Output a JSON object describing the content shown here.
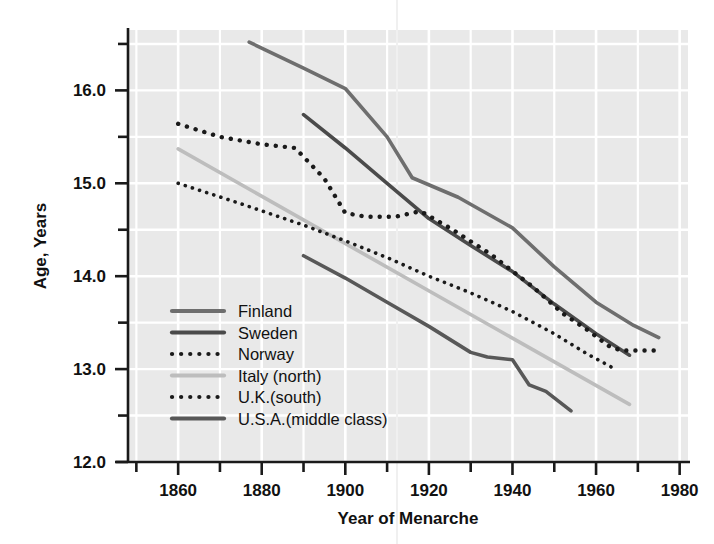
{
  "chart_data": {
    "type": "line",
    "title": "",
    "xlabel": "Year of Menarche",
    "ylabel": "Age, Years",
    "xlim": [
      1848,
      1982
    ],
    "ylim": [
      12.0,
      16.65
    ],
    "xticks": [
      1860,
      1880,
      1900,
      1920,
      1940,
      1960,
      1980
    ],
    "xtick_labels": [
      "1860",
      "1880",
      "1900",
      "1920",
      "1940",
      "1960",
      "1980"
    ],
    "xminor_step": 10,
    "yticks": [
      12.0,
      13.0,
      14.0,
      15.0,
      16.0
    ],
    "ytick_labels": [
      "12.0",
      "13.0",
      "14.0",
      "15.0",
      "16.0"
    ],
    "yminor_ticks": [
      12.5,
      13.5,
      14.5,
      15.5
    ],
    "grid": true,
    "grid_color": "#ffffff",
    "plot_background": "#e9e9e9",
    "legend_position": "lower-left-inside",
    "series": [
      {
        "name": "Finland",
        "style": "solid",
        "color": "#6e6e6e",
        "width": 3.6,
        "points": [
          [
            1877,
            16.52
          ],
          [
            1890,
            16.24
          ],
          [
            1900,
            16.02
          ],
          [
            1910,
            15.5
          ],
          [
            1916,
            15.06
          ],
          [
            1927,
            14.85
          ],
          [
            1940,
            14.52
          ],
          [
            1950,
            14.1
          ],
          [
            1960,
            13.72
          ],
          [
            1969,
            13.47
          ],
          [
            1975,
            13.34
          ]
        ]
      },
      {
        "name": "Sweden",
        "style": "solid",
        "color": "#4a4a4a",
        "width": 3.6,
        "points": [
          [
            1890,
            15.74
          ],
          [
            1900,
            15.38
          ],
          [
            1910,
            15.0
          ],
          [
            1920,
            14.62
          ],
          [
            1930,
            14.33
          ],
          [
            1940,
            14.05
          ],
          [
            1950,
            13.7
          ],
          [
            1960,
            13.38
          ],
          [
            1968,
            13.15
          ]
        ]
      },
      {
        "name": "Norway",
        "style": "dotted",
        "color": "#1a1a1a",
        "width": 4.4,
        "points": [
          [
            1860,
            15.64
          ],
          [
            1870,
            15.5
          ],
          [
            1880,
            15.42
          ],
          [
            1888,
            15.38
          ],
          [
            1895,
            15.05
          ],
          [
            1900,
            14.68
          ],
          [
            1905,
            14.64
          ],
          [
            1912,
            14.64
          ],
          [
            1918,
            14.7
          ],
          [
            1925,
            14.52
          ],
          [
            1935,
            14.23
          ],
          [
            1945,
            13.88
          ],
          [
            1952,
            13.6
          ],
          [
            1958,
            13.42
          ],
          [
            1963,
            13.25
          ],
          [
            1966,
            13.2
          ],
          [
            1975,
            13.2
          ]
        ]
      },
      {
        "name": "Italy (north)",
        "style": "solid",
        "color": "#bdbdbd",
        "width": 3.6,
        "points": [
          [
            1860,
            15.37
          ],
          [
            1968,
            12.62
          ]
        ]
      },
      {
        "name": "U.K.(south)",
        "style": "dotted",
        "color": "#1a1a1a",
        "width": 3.6,
        "points": [
          [
            1860,
            15.0
          ],
          [
            1875,
            14.78
          ],
          [
            1890,
            14.55
          ],
          [
            1900,
            14.38
          ],
          [
            1910,
            14.2
          ],
          [
            1920,
            14.0
          ],
          [
            1930,
            13.82
          ],
          [
            1940,
            13.62
          ],
          [
            1950,
            13.38
          ],
          [
            1958,
            13.16
          ],
          [
            1965,
            12.99
          ]
        ]
      },
      {
        "name": "U.S.A.(middle class)",
        "style": "solid",
        "color": "#585858",
        "width": 3.6,
        "points": [
          [
            1890,
            14.22
          ],
          [
            1900,
            13.98
          ],
          [
            1910,
            13.72
          ],
          [
            1920,
            13.46
          ],
          [
            1930,
            13.18
          ],
          [
            1934,
            13.13
          ],
          [
            1940,
            13.1
          ],
          [
            1944,
            12.83
          ],
          [
            1948,
            12.76
          ],
          [
            1954,
            12.55
          ]
        ]
      }
    ]
  },
  "legend": {
    "items": [
      {
        "label": "Finland",
        "style": "solid",
        "color": "#6e6e6e"
      },
      {
        "label": "Sweden",
        "style": "solid",
        "color": "#4a4a4a"
      },
      {
        "label": "Norway",
        "style": "dotted",
        "color": "#1a1a1a"
      },
      {
        "label": "Italy (north)",
        "style": "solid",
        "color": "#bdbdbd"
      },
      {
        "label": "U.K.(south)",
        "style": "dotted",
        "color": "#1a1a1a"
      },
      {
        "label": "U.S.A.(middle class)",
        "style": "solid",
        "color": "#585858"
      }
    ]
  }
}
